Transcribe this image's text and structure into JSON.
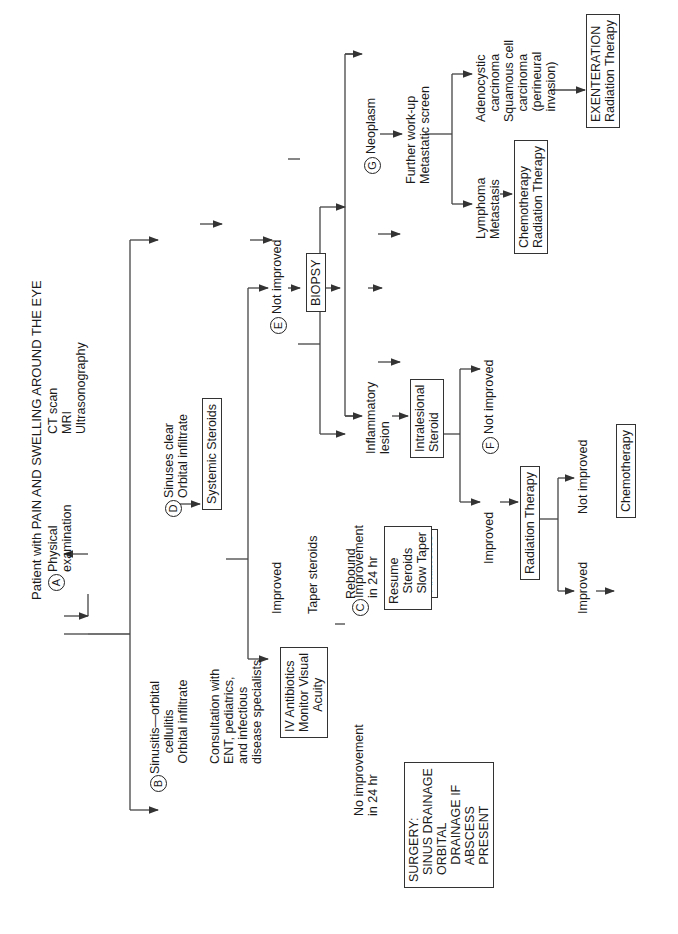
{
  "title": "Patient with PAIN AND SWELLING AROUND THE EYE",
  "markers": {
    "A": "A",
    "B": "B",
    "C": "C",
    "D": "D",
    "E": "E",
    "F": "F",
    "G": "G"
  },
  "nodes": {
    "physical_exam": "Physical\nexamination",
    "imaging": "CT scan\nMRI\nUltrasonography",
    "sinusitis": "Sinusitis—orbital\n      cellulitis\n   Orbital infiltrate",
    "consultation": "Consultation with\nENT, pediatrics,\nand infectious\ndisease specialists",
    "iv_antibiotics": "IV Antibiotics\nMonitor Visual\n      Acuity",
    "no_improvement_24": "No improvement\nin 24 hr",
    "improvement_24": "Improvement\nin 24 hr",
    "surgery": "SURGERY:\n  SINUS DRAINAGE\n  ORBITAL\n     DRAINAGE IF\n     ABSCESS\n     PRESENT",
    "continue_antibiotics": "Continue\nAntibiotics",
    "sinuses_clear": "Sinuses clear\nOrbital infiltrate",
    "systemic_steroids": "Systemic Steroids",
    "improved_1": "Improved",
    "taper_steroids": "Taper steroids",
    "rebound": "Rebound",
    "resume_steroids": "Resume\n   Steroids\n   Slow Taper",
    "not_improved_e": "Not improved",
    "biopsy": "BIOPSY",
    "inflammatory_lesion": "Inflammatory\nlesion",
    "intralesional_steroid": "Intralesional\nSteroid",
    "improved_2": "Improved",
    "not_improved_f": "Not improved",
    "radiation_therapy": "Radiation Therapy",
    "improved_3": "Improved",
    "not_improved_3": "Not improved",
    "chemotherapy": "Chemotherapy",
    "neoplasm": "Neoplasm",
    "further_workup": "Further work-up\nMetastatic screen",
    "lymphoma": "Lymphoma\nMetastasis",
    "chemo_radiation": "Chemotherapy\nRadiation Therapy",
    "adenocystic": "Adenocystic\n   carcinoma\nSquamous cell\n   carcinoma\n   (perineural\n   invasion)",
    "exenteration": "EXENTERATION\nRadiation Therapy"
  }
}
